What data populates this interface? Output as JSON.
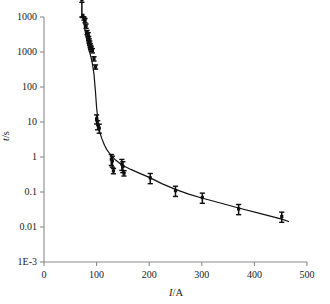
{
  "chart_data": {
    "type": "scatter",
    "title": "",
    "subtitle": "",
    "xlabel": "I/A",
    "xlabel_italic_part": "I",
    "xlabel_rest": "/A",
    "ylabel": "t/s",
    "ylabel_italic_part": "t",
    "ylabel_rest": "/s",
    "xscale": "linear",
    "yscale": "log",
    "xlim": [
      0,
      500
    ],
    "ylim": [
      0.001,
      1000
    ],
    "grid": false,
    "legend": false,
    "legend_position": "none",
    "xticks": [
      0,
      100,
      200,
      300,
      400,
      500
    ],
    "xtick_labels": [
      "0",
      "100",
      "200",
      "300",
      "400",
      "500"
    ],
    "yticks": [
      1000,
      1000,
      100,
      10,
      1,
      0.1,
      0.01,
      0.001
    ],
    "ytick_labels": [
      "1000",
      "1000",
      "100",
      "10",
      "1",
      "0.1",
      "0.01",
      "1E-3"
    ],
    "series": [
      {
        "name": "measured",
        "marker": "square-with-error-bars",
        "x": [
          72,
          74,
          76,
          78,
          80,
          82,
          84,
          85,
          86,
          87,
          88,
          89,
          90,
          92,
          95,
          98,
          100,
          102,
          105,
          128,
          130,
          132,
          148,
          150,
          152,
          202,
          250,
          301,
          370,
          452
        ],
        "y": [
          2600,
          1100,
          950,
          820,
          600,
          420,
          370,
          300,
          260,
          230,
          200,
          180,
          165,
          150,
          95,
          60,
          3.2,
          2.3,
          1.9,
          0.33,
          0.3,
          0.17,
          0.25,
          0.22,
          0.15,
          0.115,
          0.056,
          0.038,
          0.02,
          0.013
        ],
        "yerr_rel": [
          0.12,
          0.12,
          0.12,
          0.12,
          0.12,
          0.12,
          0.12,
          0.12,
          0.12,
          0.12,
          0.12,
          0.12,
          0.12,
          0.12,
          0.12,
          0.12,
          0.25,
          0.25,
          0.25,
          0.3,
          0.3,
          0.15,
          0.3,
          0.3,
          0.15,
          0.28,
          0.28,
          0.28,
          0.28,
          0.28
        ]
      },
      {
        "name": "fit",
        "type": "line",
        "x": [
          71,
          72,
          74,
          76,
          78,
          80,
          82,
          84,
          86,
          88,
          90,
          92,
          95,
          98,
          100,
          103,
          106,
          110,
          115,
          120,
          128,
          135,
          145,
          152,
          165,
          180,
          200,
          225,
          250,
          275,
          300,
          330,
          370,
          410,
          452,
          465
        ],
        "y": [
          4200,
          2400,
          1100,
          700,
          470,
          330,
          245,
          190,
          150,
          120,
          95,
          72,
          40,
          14,
          6.0,
          2.6,
          1.5,
          1.05,
          0.72,
          0.55,
          0.4,
          0.325,
          0.255,
          0.225,
          0.185,
          0.152,
          0.118,
          0.082,
          0.06,
          0.046,
          0.037,
          0.029,
          0.021,
          0.0155,
          0.0112,
          0.0098
        ]
      }
    ]
  },
  "figure": {
    "background_color": "#ffffff",
    "axis_color": "#8a8a8a",
    "data_color": "#0d0d0d",
    "curve_color": "#111111"
  }
}
